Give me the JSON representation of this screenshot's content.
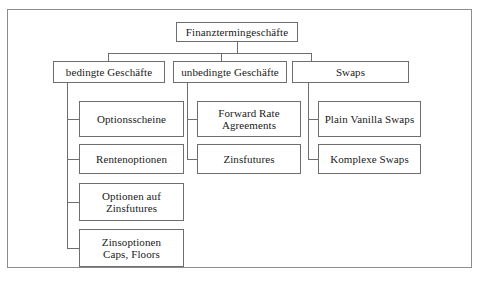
{
  "diagram": {
    "title_text": "Finanztermingeschäfte",
    "root": {
      "label": "Finanztermingeschäfte"
    },
    "branches": [
      {
        "label": "bedingte Geschäfte",
        "children": [
          {
            "label": "Optionsscheine"
          },
          {
            "label": "Rentenoptionen"
          },
          {
            "label": "Optionen auf\nZinsfutures"
          },
          {
            "label": "Zinsoptionen\nCaps, Floors"
          }
        ]
      },
      {
        "label": "unbedingte Geschäfte",
        "children": [
          {
            "label": "Forward Rate\nAgreements"
          },
          {
            "label": "Zinsfutures"
          }
        ]
      },
      {
        "label": "Swaps",
        "children": [
          {
            "label": "Plain Vanilla Swaps"
          },
          {
            "label": "Komplexe Swaps"
          }
        ]
      }
    ],
    "colors": {
      "border": "#6e6e6e",
      "frame": "#8c8c8c",
      "background": "#ffffff",
      "text": "#1a1a1a"
    }
  }
}
